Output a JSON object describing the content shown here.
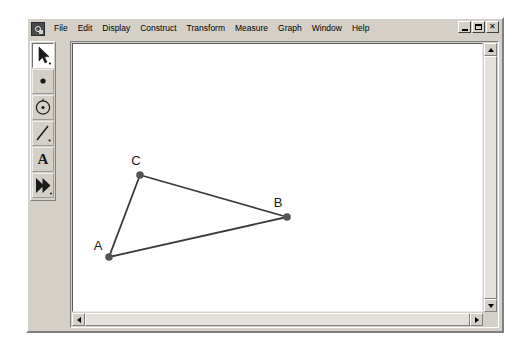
{
  "app": {
    "icon": "sketchpad-app-icon",
    "window_controls": [
      {
        "name": "minimize",
        "glyph": "_"
      },
      {
        "name": "restore",
        "glyph": "❐"
      },
      {
        "name": "close",
        "glyph": "×"
      }
    ]
  },
  "menubar": {
    "items": [
      {
        "label": "File"
      },
      {
        "label": "Edit"
      },
      {
        "label": "Display"
      },
      {
        "label": "Construct"
      },
      {
        "label": "Transform"
      },
      {
        "label": "Measure"
      },
      {
        "label": "Graph"
      },
      {
        "label": "Window"
      },
      {
        "label": "Help"
      }
    ]
  },
  "toolbar": {
    "tools": [
      {
        "name": "selection-arrow-tool",
        "icon": "arrow-icon",
        "active": true
      },
      {
        "name": "point-tool",
        "icon": "point-icon",
        "active": false
      },
      {
        "name": "compass-tool",
        "icon": "circle-icon",
        "active": false
      },
      {
        "name": "straightedge-tool",
        "icon": "line-segment-icon",
        "active": false
      },
      {
        "name": "text-tool",
        "icon": "letter-a-icon",
        "label": "A",
        "active": false
      },
      {
        "name": "custom-tool",
        "icon": "double-arrow-icon",
        "active": false
      }
    ]
  },
  "sketch": {
    "points": [
      {
        "label": "A",
        "x": 107,
        "y": 254,
        "label_x": 96,
        "label_y": 247
      },
      {
        "label": "B",
        "x": 285,
        "y": 214,
        "label_x": 276,
        "label_y": 204
      },
      {
        "label": "C",
        "x": 138,
        "y": 172,
        "label_x": 134,
        "label_y": 162
      }
    ],
    "segments": [
      {
        "from": "A",
        "to": "C"
      },
      {
        "from": "C",
        "to": "B"
      },
      {
        "from": "A",
        "to": "B"
      }
    ],
    "point_color": "#555555",
    "segment_color": "#3a3a3a",
    "canvas_color": "#ffffff"
  },
  "scrollbars": {
    "vertical": {
      "up": "scroll-up",
      "down": "scroll-down"
    },
    "horizontal": {
      "left": "scroll-left",
      "right": "scroll-right"
    }
  },
  "theme": {
    "chrome": "#d4d0c8",
    "shadow": "#808080",
    "highlight": "#ffffff"
  }
}
